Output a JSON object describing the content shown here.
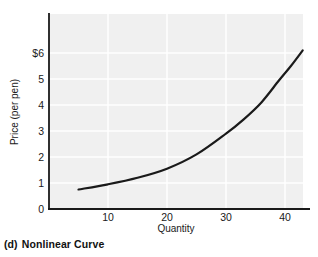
{
  "caption": {
    "index": "(d)",
    "text": "Nonlinear Curve"
  },
  "colors": {
    "plot_background": "#f0f0f0",
    "gridline": "#ffffff",
    "axis": "#1a1a1a",
    "curve": "#1a1a1a",
    "text": "#1a1a1a"
  },
  "chart_data": {
    "type": "line",
    "title": "",
    "subtitle": "",
    "xlabel": "Quantity",
    "ylabel": "Price (per pen)",
    "xlim": [
      0,
      43
    ],
    "ylim": [
      0,
      6.5
    ],
    "xticks": [
      10,
      20,
      30,
      40
    ],
    "xtick_labels": [
      "10",
      "20",
      "30",
      "40"
    ],
    "yticks": [
      0,
      1,
      2,
      3,
      4,
      5,
      6
    ],
    "ytick_labels": [
      "0",
      "1",
      "2",
      "3",
      "4",
      "5",
      "$6"
    ],
    "grid": true,
    "legend": null,
    "legend_position": "none",
    "annotations": [],
    "series": [
      {
        "name": "Nonlinear Curve",
        "x": [
          5,
          10,
          15,
          20,
          25,
          30,
          33,
          36,
          39,
          41,
          43
        ],
        "y": [
          0.75,
          0.95,
          1.2,
          1.55,
          2.1,
          2.9,
          3.45,
          4.1,
          4.95,
          5.5,
          6.1
        ]
      }
    ]
  }
}
